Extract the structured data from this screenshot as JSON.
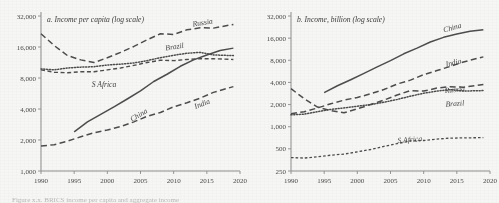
{
  "figure": {
    "caption": "Figure x.x. BRICS income per capita and aggregate income"
  },
  "panels": [
    {
      "id": "a",
      "title": "a. Income per capita (log scale)",
      "y_ticks": [
        "1,000",
        "2,000",
        "4,000",
        "8,000",
        "16,000",
        "32,000"
      ],
      "x_ticks": [
        "1990",
        "1995",
        "2000",
        "2005",
        "2010",
        "2015",
        "2020"
      ],
      "series_labels": [
        "Russia",
        "Brazil",
        "S Africa",
        "China",
        "India"
      ]
    },
    {
      "id": "b",
      "title": "b. Income, billion (log scale)",
      "y_ticks": [
        "250",
        "500",
        "1,000",
        "2,000",
        "4,000",
        "8,000",
        "16,000",
        "32,000"
      ],
      "x_ticks": [
        "1990",
        "1995",
        "2000",
        "2005",
        "2010",
        "2015",
        "2020"
      ],
      "series_labels": [
        "China",
        "India",
        "Russia",
        "Brazil",
        "S Africa"
      ]
    }
  ],
  "chart_data": [
    {
      "type": "line",
      "title": "a. Income per capita (log scale)",
      "xlabel": "",
      "ylabel": "",
      "xlim": [
        1990,
        2020
      ],
      "ylim": [
        1000,
        32000
      ],
      "yscale": "log",
      "grid": false,
      "legend": "inline-labels",
      "yticks": [
        1000,
        2000,
        4000,
        8000,
        16000,
        32000
      ],
      "xticks": [
        1990,
        1995,
        2000,
        2005,
        2010,
        2015,
        2020
      ],
      "series": [
        {
          "name": "Russia",
          "style": "long-dash",
          "x": [
            1990,
            1992,
            1994,
            1996,
            1998,
            2000,
            2002,
            2004,
            2006,
            2008,
            2010,
            2012,
            2014,
            2016,
            2019
          ],
          "values": [
            21500,
            16500,
            13200,
            12000,
            11300,
            12600,
            14200,
            16200,
            18800,
            21500,
            21200,
            23500,
            24600,
            24400,
            26500
          ]
        },
        {
          "name": "Brazil",
          "style": "dotted",
          "x": [
            1990,
            1992,
            1994,
            1996,
            1998,
            2000,
            2002,
            2004,
            2006,
            2008,
            2010,
            2012,
            2014,
            2016,
            2019
          ],
          "values": [
            9800,
            9600,
            10000,
            10200,
            10300,
            10700,
            10900,
            11200,
            11800,
            12600,
            13300,
            13900,
            14200,
            13400,
            13200
          ]
        },
        {
          "name": "S Africa",
          "style": "medium-dash",
          "x": [
            1990,
            1992,
            1994,
            1996,
            1998,
            2000,
            2002,
            2004,
            2006,
            2008,
            2010,
            2012,
            2014,
            2016,
            2019
          ],
          "values": [
            9600,
            9100,
            9000,
            9200,
            9200,
            9600,
            10000,
            10600,
            11300,
            11900,
            11800,
            12100,
            12300,
            12300,
            12100
          ]
        },
        {
          "name": "China",
          "style": "solid",
          "x": [
            1995,
            1997,
            1999,
            2001,
            2003,
            2005,
            2007,
            2009,
            2011,
            2013,
            2015,
            2017,
            2019
          ],
          "values": [
            2400,
            3000,
            3550,
            4200,
            5000,
            6000,
            7400,
            8700,
            10400,
            12000,
            13400,
            14800,
            15600
          ]
        },
        {
          "name": "India",
          "style": "long-dash",
          "x": [
            1990,
            1992,
            1994,
            1996,
            1998,
            2000,
            2002,
            2004,
            2006,
            2008,
            2010,
            2012,
            2014,
            2016,
            2019
          ],
          "values": [
            1750,
            1800,
            1950,
            2150,
            2350,
            2500,
            2700,
            3000,
            3400,
            3700,
            4200,
            4600,
            5100,
            5800,
            6600
          ]
        }
      ]
    },
    {
      "type": "line",
      "title": "b. Income, billion (log scale)",
      "xlabel": "",
      "ylabel": "",
      "xlim": [
        1990,
        2020
      ],
      "ylim": [
        250,
        32000
      ],
      "yscale": "log",
      "grid": false,
      "legend": "inline-labels",
      "yticks": [
        250,
        500,
        1000,
        2000,
        4000,
        8000,
        16000,
        32000
      ],
      "xticks": [
        1990,
        1995,
        2000,
        2005,
        2010,
        2015,
        2020
      ],
      "series": [
        {
          "name": "China",
          "style": "solid",
          "x": [
            1995,
            1997,
            1999,
            2001,
            2003,
            2005,
            2007,
            2009,
            2011,
            2013,
            2015,
            2017,
            2019
          ],
          "values": [
            2900,
            3600,
            4350,
            5300,
            6500,
            7900,
            9800,
            11700,
            14200,
            16400,
            18200,
            19800,
            20800
          ]
        },
        {
          "name": "India",
          "style": "long-dash",
          "x": [
            1990,
            1992,
            1994,
            1996,
            1998,
            2000,
            2002,
            2004,
            2006,
            2008,
            2010,
            2012,
            2014,
            2016,
            2019
          ],
          "values": [
            1500,
            1600,
            1800,
            2050,
            2300,
            2500,
            2800,
            3200,
            3800,
            4300,
            5100,
            5800,
            6600,
            7600,
            8900
          ]
        },
        {
          "name": "Russia",
          "style": "long-dash",
          "x": [
            1990,
            1992,
            1994,
            1996,
            1998,
            2000,
            2002,
            2004,
            2006,
            2008,
            2010,
            2012,
            2014,
            2016,
            2019
          ],
          "values": [
            3300,
            2400,
            1850,
            1650,
            1550,
            1750,
            2000,
            2300,
            2700,
            3100,
            3050,
            3350,
            3500,
            3450,
            3750
          ]
        },
        {
          "name": "Brazil",
          "style": "dotted",
          "x": [
            1990,
            1992,
            1994,
            1996,
            1998,
            2000,
            2002,
            2004,
            2006,
            2008,
            2010,
            2012,
            2014,
            2016,
            2019
          ],
          "values": [
            1450,
            1480,
            1600,
            1720,
            1800,
            1900,
            2000,
            2150,
            2350,
            2600,
            2850,
            3050,
            3200,
            3050,
            3100
          ]
        },
        {
          "name": "S Africa",
          "style": "short-dash",
          "x": [
            1990,
            1992,
            1994,
            1996,
            1998,
            2000,
            2002,
            2004,
            2006,
            2008,
            2010,
            2012,
            2014,
            2016,
            2019
          ],
          "values": [
            380,
            375,
            390,
            410,
            425,
            455,
            490,
            540,
            590,
            640,
            650,
            680,
            700,
            705,
            710
          ]
        }
      ]
    }
  ]
}
